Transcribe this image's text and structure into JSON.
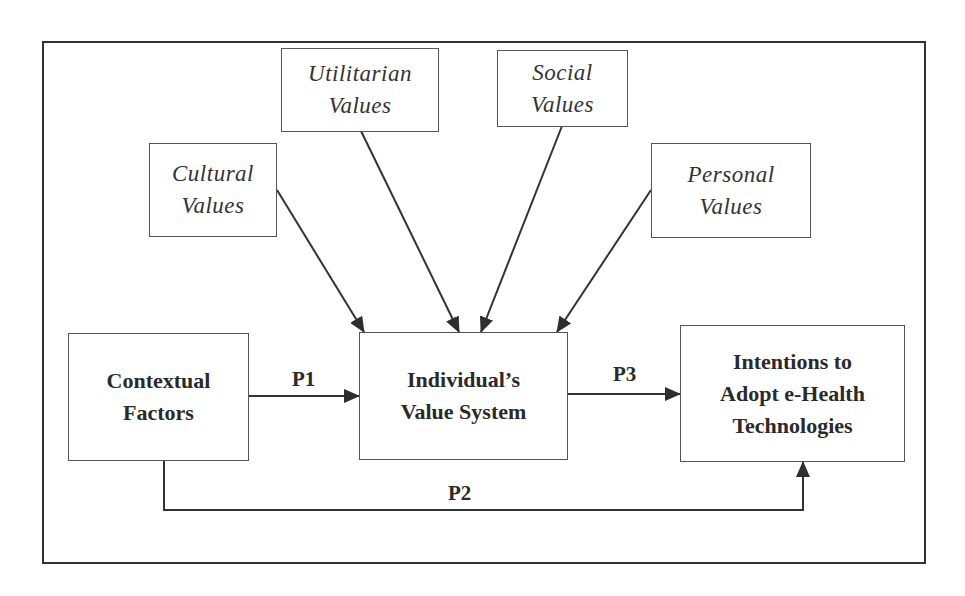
{
  "diagram": {
    "influences": [
      {
        "id": "cultural",
        "lines": [
          "Cultural",
          "Values"
        ]
      },
      {
        "id": "utilitarian",
        "lines": [
          "Utilitarian",
          "Values"
        ]
      },
      {
        "id": "social",
        "lines": [
          "Social",
          "Values"
        ]
      },
      {
        "id": "personal",
        "lines": [
          "Personal",
          "Values"
        ]
      }
    ],
    "nodes": {
      "contextual": {
        "lines": [
          "Contextual",
          "Factors"
        ]
      },
      "individual": {
        "lines": [
          "Individual’s",
          "Value System"
        ]
      },
      "intentions": {
        "lines": [
          "Intentions to",
          "Adopt e-Health",
          "Technologies"
        ]
      }
    },
    "paths": {
      "p1": "P1",
      "p2": "P2",
      "p3": "P3"
    },
    "edges": [
      {
        "from": "cultural",
        "to": "individual"
      },
      {
        "from": "utilitarian",
        "to": "individual"
      },
      {
        "from": "social",
        "to": "individual"
      },
      {
        "from": "personal",
        "to": "individual"
      },
      {
        "from": "contextual",
        "to": "individual",
        "label": "P1"
      },
      {
        "from": "individual",
        "to": "intentions",
        "label": "P3"
      },
      {
        "from": "contextual",
        "to": "intentions",
        "label": "P2"
      }
    ],
    "colors": {
      "line": "#333333",
      "text": "#2a2a2a",
      "background": "#ffffff"
    }
  }
}
